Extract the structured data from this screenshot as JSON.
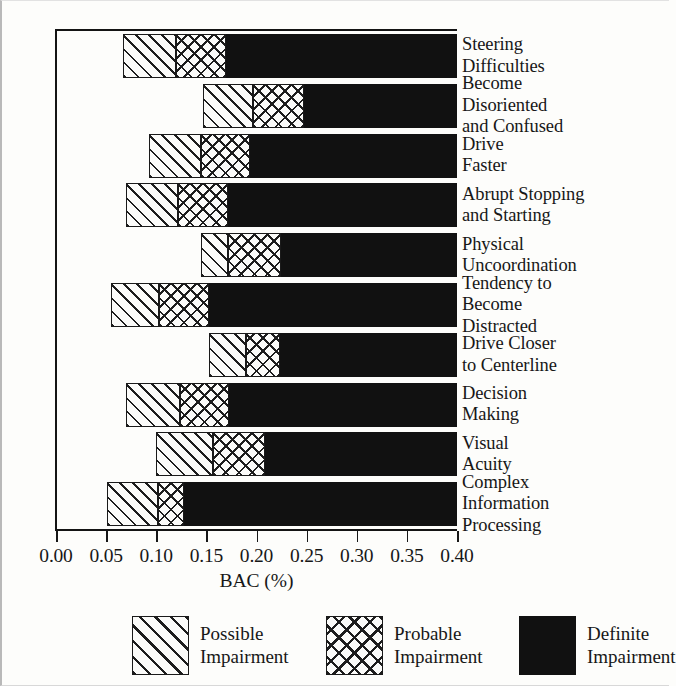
{
  "chart_data": {
    "type": "bar",
    "orientation": "horizontal",
    "subtype": "stacked-range",
    "title": "",
    "xlabel": "BAC (%)",
    "ylabel": "",
    "xlim": [
      0.0,
      0.4
    ],
    "xticks": [
      "0.00",
      "0.05",
      "0.10",
      "0.15",
      "0.20",
      "0.25",
      "0.30",
      "0.35",
      "0.40"
    ],
    "xtick_values": [
      0.0,
      0.05,
      0.1,
      0.15,
      0.2,
      0.25,
      0.3,
      0.35,
      0.4
    ],
    "grid": false,
    "legend_position": "bottom",
    "categories": [
      "Steering Difficulties",
      "Become Disoriented and Confused",
      "Drive Faster",
      "Abrupt Stopping and Starting",
      "Physical Uncoordination",
      "Tendency to Become Distracted",
      "Drive Closer to Centerline",
      "Decision Making",
      "Visual Acuity",
      "Complex Information Processing"
    ],
    "series": [
      {
        "name": "Possible Impairment",
        "pattern": "diagonal-hatch",
        "color": "#fbfbf9",
        "starts": [
          0.067,
          0.147,
          0.093,
          0.07,
          0.145,
          0.055,
          0.153,
          0.07,
          0.1,
          0.051
        ],
        "ends": [
          0.12,
          0.197,
          0.145,
          0.122,
          0.172,
          0.103,
          0.19,
          0.124,
          0.157,
          0.102
        ]
      },
      {
        "name": "Probable Impairment",
        "pattern": "crosshatch",
        "color": "#fbfbf9",
        "starts": [
          0.12,
          0.197,
          0.145,
          0.122,
          0.172,
          0.103,
          0.19,
          0.124,
          0.157,
          0.102
        ],
        "ends": [
          0.17,
          0.247,
          0.194,
          0.172,
          0.224,
          0.153,
          0.223,
          0.173,
          0.208,
          0.128
        ]
      },
      {
        "name": "Definite Impairment",
        "pattern": "solid",
        "color": "#111111",
        "starts": [
          0.17,
          0.247,
          0.194,
          0.172,
          0.224,
          0.153,
          0.223,
          0.173,
          0.208,
          0.128
        ],
        "ends": [
          0.4,
          0.4,
          0.4,
          0.4,
          0.4,
          0.4,
          0.4,
          0.4,
          0.4,
          0.4
        ]
      }
    ]
  },
  "category_label_lines": [
    [
      "Steering",
      "Difficulties"
    ],
    [
      "Become",
      "Disoriented",
      "and Confused"
    ],
    [
      "Drive",
      "Faster"
    ],
    [
      "Abrupt Stopping",
      "and Starting"
    ],
    [
      "Physical",
      "Uncoordination"
    ],
    [
      "Tendency to",
      "Become",
      "Distracted"
    ],
    [
      "Drive Closer",
      "to Centerline"
    ],
    [
      "Decision",
      "Making"
    ],
    [
      "Visual",
      "Acuity"
    ],
    [
      "Complex",
      "Information",
      "Processing"
    ]
  ],
  "legend": {
    "items": [
      {
        "label_lines": [
          "Possible",
          "Impairment"
        ],
        "pattern": "possible"
      },
      {
        "label_lines": [
          "Probable",
          "Impairment"
        ],
        "pattern": "probable"
      },
      {
        "label_lines": [
          "Definite",
          "Impairment"
        ],
        "pattern": "definite"
      }
    ]
  },
  "axis": {
    "title": "BAC (%)"
  }
}
